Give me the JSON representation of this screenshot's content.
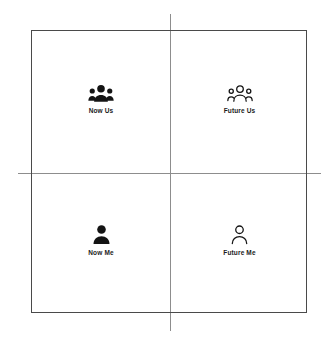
{
  "diagram": {
    "type": "2x2-quadrant-matrix",
    "background_color": "#ffffff",
    "frame_color": "#4a4a4a",
    "axis_color": "#8d8d8d",
    "label_color": "#1c1c1c",
    "quadrants": [
      {
        "position": "top-left",
        "label": "Now Us",
        "icon": "group-filled-icon",
        "icon_style": "filled"
      },
      {
        "position": "top-right",
        "label": "Future Us",
        "icon": "group-outline-icon",
        "icon_style": "outline"
      },
      {
        "position": "bottom-left",
        "label": "Now Me",
        "icon": "person-filled-icon",
        "icon_style": "filled"
      },
      {
        "position": "bottom-right",
        "label": "Future Me",
        "icon": "person-outline-icon",
        "icon_style": "outline"
      }
    ]
  }
}
